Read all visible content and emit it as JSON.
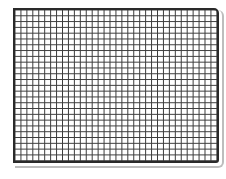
{
  "figure": {
    "type": "grid",
    "columns": 34,
    "rows": 26,
    "line_color": "#3a3a3a",
    "border_color": "#2a2a2a",
    "background_color": "#ffffff",
    "shadow_color": "#bdbdbd"
  }
}
